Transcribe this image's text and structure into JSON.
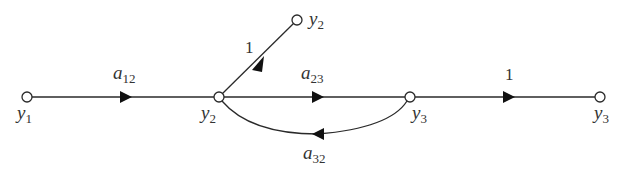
{
  "diagram": {
    "type": "signal-flow-graph",
    "colors": {
      "line": "#2a2a2a",
      "arrow": "#111111",
      "text": "#333333",
      "background": "#ffffff"
    },
    "nodes": [
      {
        "id": "n_y1",
        "label": "y",
        "sub": "1",
        "x": 27,
        "y": 97
      },
      {
        "id": "n_y2",
        "label": "y",
        "sub": "2",
        "x": 219,
        "y": 97
      },
      {
        "id": "n_y2_out",
        "label": "y",
        "sub": "2",
        "x": 297,
        "y": 20
      },
      {
        "id": "n_y3",
        "label": "y",
        "sub": "3",
        "x": 410,
        "y": 97
      },
      {
        "id": "n_y3_out",
        "label": "y",
        "sub": "3",
        "x": 600,
        "y": 97
      }
    ],
    "edges": [
      {
        "from": "y1",
        "to": "y2",
        "gain_main": "a",
        "gain_sub": "12"
      },
      {
        "from": "y2",
        "to": "y2 (output)",
        "gain_main": "1",
        "gain_sub": ""
      },
      {
        "from": "y2",
        "to": "y3",
        "gain_main": "a",
        "gain_sub": "23"
      },
      {
        "from": "y3",
        "to": "y2",
        "gain_main": "a",
        "gain_sub": "32"
      },
      {
        "from": "y3",
        "to": "y3 (output)",
        "gain_main": "1",
        "gain_sub": ""
      }
    ]
  }
}
